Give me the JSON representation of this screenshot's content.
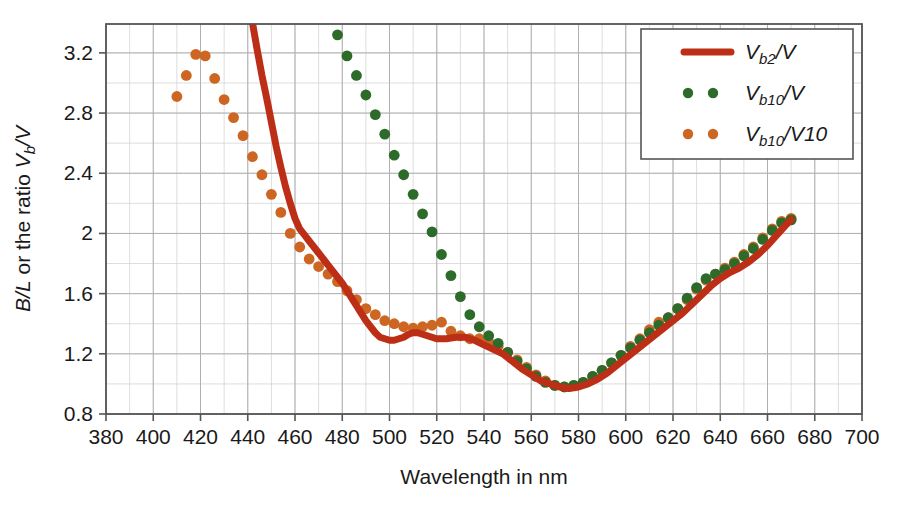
{
  "chart_data": {
    "type": "scatter",
    "title": "",
    "xlabel": "Wavelength in nm",
    "ylabel": "B/L or the ratio Vb/V",
    "ylabel_parts": {
      "lead": "B/L",
      "mid": " or the ratio ",
      "sym": "V",
      "subsym": "b",
      "den": "/V"
    },
    "xlim": [
      380,
      700
    ],
    "ylim": [
      0.8,
      3.392
    ],
    "xticks": [
      380,
      400,
      420,
      440,
      460,
      480,
      500,
      520,
      540,
      560,
      580,
      600,
      620,
      640,
      660,
      680,
      700
    ],
    "yticks": [
      0.8,
      1.2,
      1.6,
      2,
      2.4,
      2.8,
      3.2
    ],
    "xtick_labels": [
      "380",
      "400",
      "420",
      "440",
      "460",
      "480",
      "500",
      "520",
      "540",
      "560",
      "580",
      "600",
      "620",
      "640",
      "660",
      "680",
      "700"
    ],
    "ytick_labels": [
      "0.8",
      "1.2",
      "1.6",
      "2",
      "2.4",
      "2.8",
      "3.2"
    ],
    "xminor_step": 10,
    "yminor_step": 0.2,
    "grid": true,
    "grid_color": "#b0b0b0",
    "axis_color": "#555555",
    "background": "#ffffff",
    "legend_position": "top-right",
    "series": [
      {
        "name": "Vb2/V",
        "kind": "line",
        "color": "#bd2e16",
        "legend_parts": {
          "sym": "V",
          "sub": "b2",
          "den": "/V"
        },
        "points": [
          [
            442,
            3.4
          ],
          [
            444,
            3.22
          ],
          [
            446,
            3.05
          ],
          [
            448,
            2.9
          ],
          [
            450,
            2.74
          ],
          [
            452,
            2.58
          ],
          [
            454,
            2.44
          ],
          [
            456,
            2.31
          ],
          [
            458,
            2.2
          ],
          [
            460,
            2.1
          ],
          [
            462,
            2.03
          ],
          [
            464,
            1.99
          ],
          [
            466,
            1.95
          ],
          [
            468,
            1.91
          ],
          [
            470,
            1.87
          ],
          [
            472,
            1.83
          ],
          [
            474,
            1.79
          ],
          [
            476,
            1.75
          ],
          [
            478,
            1.71
          ],
          [
            480,
            1.67
          ],
          [
            482,
            1.62
          ],
          [
            484,
            1.57
          ],
          [
            486,
            1.52
          ],
          [
            488,
            1.47
          ],
          [
            490,
            1.42
          ],
          [
            492,
            1.38
          ],
          [
            494,
            1.34
          ],
          [
            496,
            1.31
          ],
          [
            498,
            1.3
          ],
          [
            500,
            1.29
          ],
          [
            502,
            1.29
          ],
          [
            504,
            1.3
          ],
          [
            506,
            1.31
          ],
          [
            508,
            1.33
          ],
          [
            510,
            1.34
          ],
          [
            512,
            1.34
          ],
          [
            514,
            1.33
          ],
          [
            516,
            1.32
          ],
          [
            518,
            1.31
          ],
          [
            520,
            1.3
          ],
          [
            524,
            1.3
          ],
          [
            528,
            1.31
          ],
          [
            532,
            1.31
          ],
          [
            536,
            1.29
          ],
          [
            540,
            1.26
          ],
          [
            544,
            1.23
          ],
          [
            548,
            1.2
          ],
          [
            552,
            1.15
          ],
          [
            556,
            1.1
          ],
          [
            560,
            1.06
          ],
          [
            564,
            1.02
          ],
          [
            568,
            1.0
          ],
          [
            572,
            0.98
          ],
          [
            576,
            0.97
          ],
          [
            580,
            0.98
          ],
          [
            584,
            1.0
          ],
          [
            588,
            1.03
          ],
          [
            592,
            1.07
          ],
          [
            596,
            1.12
          ],
          [
            600,
            1.17
          ],
          [
            604,
            1.22
          ],
          [
            608,
            1.27
          ],
          [
            612,
            1.32
          ],
          [
            616,
            1.37
          ],
          [
            620,
            1.42
          ],
          [
            624,
            1.47
          ],
          [
            628,
            1.53
          ],
          [
            632,
            1.59
          ],
          [
            636,
            1.65
          ],
          [
            640,
            1.7
          ],
          [
            644,
            1.74
          ],
          [
            648,
            1.77
          ],
          [
            652,
            1.81
          ],
          [
            656,
            1.86
          ],
          [
            660,
            1.92
          ],
          [
            664,
            1.99
          ],
          [
            668,
            2.06
          ],
          [
            670,
            2.09
          ]
        ]
      },
      {
        "name": "Vb10/V",
        "kind": "dots",
        "color": "#2d6b2a",
        "legend_parts": {
          "sym": "V",
          "sub": "b10",
          "den": "/V"
        },
        "points": [
          [
            478,
            3.32
          ],
          [
            482,
            3.18
          ],
          [
            486,
            3.05
          ],
          [
            490,
            2.92
          ],
          [
            494,
            2.79
          ],
          [
            498,
            2.66
          ],
          [
            502,
            2.52
          ],
          [
            506,
            2.39
          ],
          [
            510,
            2.26
          ],
          [
            514,
            2.13
          ],
          [
            518,
            2.01
          ],
          [
            522,
            1.86
          ],
          [
            526,
            1.72
          ],
          [
            530,
            1.58
          ],
          [
            534,
            1.46
          ],
          [
            538,
            1.38
          ],
          [
            542,
            1.32
          ],
          [
            546,
            1.27
          ],
          [
            550,
            1.21
          ],
          [
            554,
            1.15
          ],
          [
            558,
            1.1
          ],
          [
            562,
            1.05
          ],
          [
            566,
            1.01
          ],
          [
            570,
            0.99
          ],
          [
            574,
            0.98
          ],
          [
            578,
            0.99
          ],
          [
            582,
            1.01
          ],
          [
            586,
            1.05
          ],
          [
            590,
            1.09
          ],
          [
            594,
            1.14
          ],
          [
            598,
            1.19
          ],
          [
            602,
            1.24
          ],
          [
            606,
            1.29
          ],
          [
            610,
            1.34
          ],
          [
            614,
            1.39
          ],
          [
            618,
            1.44
          ],
          [
            622,
            1.5
          ],
          [
            626,
            1.57
          ],
          [
            630,
            1.64
          ],
          [
            634,
            1.7
          ],
          [
            638,
            1.73
          ],
          [
            642,
            1.76
          ],
          [
            646,
            1.8
          ],
          [
            650,
            1.85
          ],
          [
            654,
            1.9
          ],
          [
            658,
            1.96
          ],
          [
            662,
            2.02
          ],
          [
            666,
            2.07
          ],
          [
            670,
            2.09
          ]
        ]
      },
      {
        "name": "Vb10/V10",
        "kind": "dots",
        "color": "#cc6622",
        "legend_parts": {
          "sym": "V",
          "sub": "b10",
          "den": "/V10"
        },
        "points": [
          [
            410,
            2.91
          ],
          [
            414,
            3.05
          ],
          [
            418,
            3.19
          ],
          [
            422,
            3.18
          ],
          [
            426,
            3.03
          ],
          [
            430,
            2.89
          ],
          [
            434,
            2.77
          ],
          [
            438,
            2.65
          ],
          [
            442,
            2.51
          ],
          [
            446,
            2.39
          ],
          [
            450,
            2.26
          ],
          [
            454,
            2.14
          ],
          [
            458,
            2.0
          ],
          [
            462,
            1.91
          ],
          [
            466,
            1.83
          ],
          [
            470,
            1.78
          ],
          [
            474,
            1.73
          ],
          [
            478,
            1.68
          ],
          [
            482,
            1.62
          ],
          [
            486,
            1.56
          ],
          [
            490,
            1.5
          ],
          [
            494,
            1.46
          ],
          [
            498,
            1.42
          ],
          [
            502,
            1.4
          ],
          [
            506,
            1.38
          ],
          [
            510,
            1.37
          ],
          [
            514,
            1.38
          ],
          [
            518,
            1.39
          ],
          [
            522,
            1.41
          ],
          [
            526,
            1.35
          ],
          [
            530,
            1.32
          ],
          [
            534,
            1.3
          ],
          [
            538,
            1.3
          ],
          [
            542,
            1.28
          ],
          [
            546,
            1.25
          ],
          [
            550,
            1.21
          ],
          [
            554,
            1.16
          ],
          [
            558,
            1.11
          ],
          [
            562,
            1.06
          ],
          [
            566,
            1.02
          ],
          [
            570,
            0.99
          ],
          [
            574,
            0.98
          ],
          [
            578,
            0.99
          ],
          [
            582,
            1.01
          ],
          [
            586,
            1.05
          ],
          [
            590,
            1.09
          ],
          [
            594,
            1.14
          ],
          [
            598,
            1.19
          ],
          [
            602,
            1.25
          ],
          [
            606,
            1.3
          ],
          [
            610,
            1.36
          ],
          [
            614,
            1.41
          ],
          [
            618,
            1.44
          ],
          [
            622,
            1.5
          ],
          [
            626,
            1.56
          ],
          [
            630,
            1.63
          ],
          [
            634,
            1.69
          ],
          [
            638,
            1.73
          ],
          [
            642,
            1.77
          ],
          [
            646,
            1.81
          ],
          [
            650,
            1.86
          ],
          [
            654,
            1.91
          ],
          [
            658,
            1.97
          ],
          [
            662,
            2.03
          ],
          [
            666,
            2.08
          ],
          [
            670,
            2.1
          ]
        ]
      }
    ]
  },
  "legend": {
    "items": [
      {
        "label": "Vb2/V",
        "style": "line"
      },
      {
        "label": "Vb10/V",
        "style": "dots"
      },
      {
        "label": "Vb10/V10",
        "style": "dots"
      }
    ]
  }
}
